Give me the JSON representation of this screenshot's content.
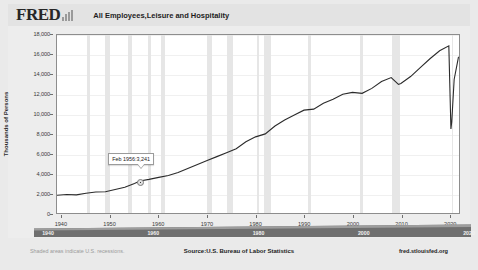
{
  "header": {
    "logo_text": "FRED",
    "logo_icon": "bar-chart-icon",
    "title": "All Employees,Leisure and Hospitality"
  },
  "footer": {
    "left_note": "Shaded areas indicate U.S. recessions.",
    "source": "Source:U.S. Bureau of Labor Statistics",
    "attribution": "fred.stlouisfed.org"
  },
  "slider": {
    "ticks": [
      "1940",
      "1960",
      "1980",
      "2000",
      "2020"
    ]
  },
  "annotation": {
    "label": "Feb 1956:3,241",
    "date": "Feb 1956",
    "value": 3241
  },
  "colors": {
    "line": "#2b2b2b",
    "recession_band": "#e6e6e6",
    "plot_background": "#ffffff",
    "page_background": "#eaeaea",
    "panel_background": "#ededed",
    "axis": "#8d8d8d"
  },
  "chart_data": {
    "type": "line",
    "title": "All Employees,Leisure and Hospitality",
    "xlabel": "",
    "ylabel": "Thousands of Persons",
    "xlim": [
      1939,
      2022
    ],
    "ylim": [
      0,
      18000
    ],
    "ytick_labels": [
      "0",
      "2,000",
      "4,000",
      "6,000",
      "8,000",
      "10,000",
      "12,000",
      "14,000",
      "16,000",
      "18,000"
    ],
    "yticks": [
      0,
      2000,
      4000,
      6000,
      8000,
      10000,
      12000,
      14000,
      16000,
      18000
    ],
    "xtick_labels": [
      "1940",
      "1950",
      "1960",
      "1970",
      "1980",
      "1990",
      "2000",
      "2010",
      "2020"
    ],
    "xticks": [
      1940,
      1950,
      1960,
      1970,
      1980,
      1990,
      2000,
      2010,
      2020
    ],
    "grid": false,
    "legend": "none",
    "series": [
      {
        "name": "All Employees, Leisure and Hospitality",
        "x": [
          1939,
          1941,
          1943,
          1945,
          1947,
          1949,
          1951,
          1953,
          1955,
          1956.1,
          1958,
          1960,
          1962,
          1964,
          1966,
          1968,
          1970,
          1972,
          1974,
          1976,
          1978,
          1980,
          1982,
          1984,
          1986,
          1988,
          1990,
          1992,
          1994,
          1996,
          1998,
          2000,
          2002,
          2004,
          2006,
          2008,
          2009.5,
          2010,
          2012,
          2014,
          2016,
          2018,
          2019.9,
          2020.33,
          2020.5,
          2021,
          2021.9
        ],
        "y": [
          1800,
          1870,
          1830,
          2000,
          2130,
          2150,
          2380,
          2600,
          2980,
          3241,
          3400,
          3600,
          3800,
          4100,
          4500,
          4900,
          5300,
          5700,
          6100,
          6500,
          7200,
          7700,
          8000,
          8800,
          9400,
          9900,
          10400,
          10500,
          11100,
          11500,
          12000,
          12200,
          12100,
          12600,
          13300,
          13700,
          13000,
          13100,
          13800,
          14700,
          15600,
          16400,
          16900,
          8500,
          9200,
          13500,
          15800
        ]
      }
    ],
    "recession_bands": [
      {
        "start": 1945.1,
        "end": 1945.8
      },
      {
        "start": 1948.9,
        "end": 1949.8
      },
      {
        "start": 1953.6,
        "end": 1954.4
      },
      {
        "start": 1957.6,
        "end": 1958.3
      },
      {
        "start": 1960.3,
        "end": 1961.1
      },
      {
        "start": 1969.9,
        "end": 1970.9
      },
      {
        "start": 1973.9,
        "end": 1975.2
      },
      {
        "start": 1980.1,
        "end": 1980.5
      },
      {
        "start": 1981.6,
        "end": 1982.9
      },
      {
        "start": 1990.6,
        "end": 1991.2
      },
      {
        "start": 2001.2,
        "end": 2001.9
      },
      {
        "start": 2007.9,
        "end": 2009.5
      },
      {
        "start": 2020.1,
        "end": 2020.4
      }
    ],
    "annotations": [
      {
        "label": "Feb 1956:3,241",
        "x": 1956.1,
        "y": 3241
      }
    ]
  }
}
